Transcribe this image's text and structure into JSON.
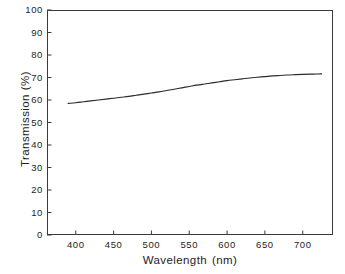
{
  "chart_data": {
    "type": "line",
    "title": "",
    "xlabel": "Wavelength",
    "xunit": "(nm)",
    "ylabel": "Transmission",
    "yunit": "(%)",
    "xlim": [
      362,
      740
    ],
    "ylim": [
      0,
      100
    ],
    "grid": false,
    "legend": false,
    "x_ticks": [
      400,
      450,
      500,
      550,
      600,
      650,
      700
    ],
    "x_tick_labels": [
      "400",
      "450",
      "500",
      "550",
      "600",
      "650",
      "700"
    ],
    "y_ticks": [
      0,
      10,
      20,
      30,
      40,
      50,
      60,
      70,
      80,
      90,
      100
    ],
    "y_tick_labels": [
      "0",
      "10",
      "20",
      "30",
      "40",
      "50",
      "60",
      "70",
      "80",
      "90",
      "100"
    ],
    "series": [
      {
        "name": "Transmission",
        "color": "#2b2b2b",
        "x": [
          390,
          400,
          410,
          420,
          430,
          440,
          450,
          460,
          470,
          480,
          490,
          500,
          510,
          520,
          530,
          540,
          550,
          560,
          570,
          580,
          590,
          600,
          610,
          620,
          630,
          640,
          650,
          660,
          670,
          680,
          690,
          700,
          710,
          720,
          725
        ],
        "values": [
          58.5,
          58.8,
          59.2,
          59.6,
          60.0,
          60.4,
          60.8,
          61.2,
          61.6,
          62.1,
          62.6,
          63.1,
          63.6,
          64.2,
          64.8,
          65.4,
          66.0,
          66.6,
          67.1,
          67.6,
          68.1,
          68.6,
          69.0,
          69.4,
          69.8,
          70.1,
          70.4,
          70.7,
          70.9,
          71.1,
          71.25,
          71.4,
          71.5,
          71.55,
          71.6
        ]
      }
    ]
  },
  "axes": {
    "x_title_text": "Wavelength",
    "x_title_unit": "(nm)",
    "y_title_text": "Transmission",
    "y_title_unit": "(%)"
  },
  "style": {
    "frame_color": "#3a3a3a",
    "curve_color": "#2b2b2b",
    "tick_color": "#3a3a3a",
    "background": "#ffffff",
    "text_color": "#242424"
  }
}
